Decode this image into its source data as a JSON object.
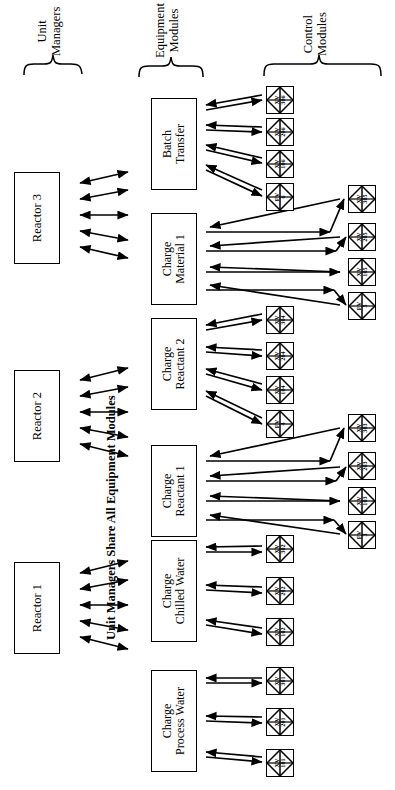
{
  "diagram": {
    "caption": "Unit Managers Share All Equipment Modules",
    "orientation": "rotated-90-ccw",
    "groups": [
      {
        "id": "unit-managers",
        "line1": "Unit",
        "line2": "Managers"
      },
      {
        "id": "equipment-modules",
        "line1": "Equipment",
        "line2": "Modules"
      },
      {
        "id": "control-modules",
        "line1": "Control",
        "line2": "Modules"
      }
    ],
    "unit_managers": [
      {
        "id": "reactor-3",
        "label": "Reactor 3",
        "arrows": 5
      },
      {
        "id": "reactor-2",
        "label": "Reactor 2",
        "arrows": 5
      },
      {
        "id": "reactor-1",
        "label": "Reactor 1",
        "arrows": 5
      }
    ],
    "equipment_modules": [
      {
        "id": "batch-transfer",
        "line1": "Batch",
        "line2": "Transfer",
        "in_arrows": 5,
        "out_arrows": 4
      },
      {
        "id": "charge-material-1",
        "line1": "Charge",
        "line2": "Material 1",
        "in_arrows": 5,
        "out_arrows": 4
      },
      {
        "id": "charge-reactant-2",
        "line1": "Charge",
        "line2": "Reactant 2",
        "in_arrows": 5,
        "out_arrows": 4
      },
      {
        "id": "charge-reactant-1",
        "line1": "Charge",
        "line2": "Reactant 1",
        "in_arrows": 5,
        "out_arrows": 4
      },
      {
        "id": "charge-chilled-water",
        "line1": "Charge",
        "line2": "Chilled Water",
        "in_arrows": 5,
        "out_arrows": 3
      },
      {
        "id": "charge-process-water",
        "line1": "Charge",
        "line2": "Process Water",
        "in_arrows": 5,
        "out_arrows": 3
      }
    ],
    "control_modules": [
      {
        "id": "cm-xv-306",
        "prefix": "XV",
        "number": "306",
        "column": "inner",
        "group": "batch-transfer"
      },
      {
        "id": "cm-xv-206",
        "prefix": "XV",
        "number": "206",
        "column": "inner",
        "group": "batch-transfer"
      },
      {
        "id": "cm-xv-106",
        "prefix": "XV",
        "number": "106",
        "column": "inner",
        "group": "batch-transfer"
      },
      {
        "id": "cm-fv-6",
        "prefix": "FV",
        "number": "6",
        "column": "inner",
        "group": "batch-transfer"
      },
      {
        "id": "cm-xv-305",
        "prefix": "XV",
        "number": "305",
        "column": "outer",
        "group": "charge-material-1"
      },
      {
        "id": "cm-xv-205",
        "prefix": "XV",
        "number": "205",
        "column": "outer",
        "group": "charge-material-1"
      },
      {
        "id": "cm-xv-105",
        "prefix": "XV",
        "number": "105",
        "column": "outer",
        "group": "charge-material-1"
      },
      {
        "id": "cm-fv-5",
        "prefix": "FV",
        "number": "5",
        "column": "outer",
        "group": "charge-material-1"
      },
      {
        "id": "cm-xv-304",
        "prefix": "XV",
        "number": "304",
        "column": "inner",
        "group": "charge-reactant-2"
      },
      {
        "id": "cm-xv-204",
        "prefix": "XV",
        "number": "204",
        "column": "inner",
        "group": "charge-reactant-2"
      },
      {
        "id": "cm-xv-104",
        "prefix": "XV",
        "number": "104",
        "column": "inner",
        "group": "charge-reactant-2"
      },
      {
        "id": "cm-fv-4",
        "prefix": "FV",
        "number": "4",
        "column": "inner",
        "group": "charge-reactant-2"
      },
      {
        "id": "cm-xv-303",
        "prefix": "XV",
        "number": "303",
        "column": "outer",
        "group": "charge-reactant-1"
      },
      {
        "id": "cm-xv-203",
        "prefix": "XV",
        "number": "203",
        "column": "outer",
        "group": "charge-reactant-1"
      },
      {
        "id": "cm-xv-103",
        "prefix": "XV",
        "number": "103",
        "column": "outer",
        "group": "charge-reactant-1"
      },
      {
        "id": "cm-fv-3",
        "prefix": "FV",
        "number": "3",
        "column": "outer",
        "group": "charge-reactant-1"
      },
      {
        "id": "cm-xv-302",
        "prefix": "XV",
        "number": "302",
        "column": "inner",
        "group": "charge-chilled-water"
      },
      {
        "id": "cm-xv-202",
        "prefix": "XV",
        "number": "202",
        "column": "inner",
        "group": "charge-chilled-water"
      },
      {
        "id": "cm-xv-102",
        "prefix": "XV",
        "number": "102",
        "column": "inner",
        "group": "charge-chilled-water"
      },
      {
        "id": "cm-xv-301",
        "prefix": "XV",
        "number": "301",
        "column": "inner",
        "group": "charge-process-water"
      },
      {
        "id": "cm-xv-201",
        "prefix": "XV",
        "number": "201",
        "column": "inner",
        "group": "charge-process-water"
      },
      {
        "id": "cm-xv-101",
        "prefix": "XV",
        "number": "101",
        "column": "inner",
        "group": "charge-process-water"
      }
    ],
    "colors": {
      "line": "#000000",
      "background": "#ffffff"
    }
  }
}
